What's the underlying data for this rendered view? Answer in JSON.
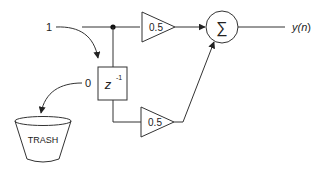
{
  "diagram": {
    "type": "signal-flow / block diagram",
    "colors": {
      "stroke": "#333333",
      "background": "#ffffff"
    },
    "input_label": "1",
    "state_label": "0",
    "delay": {
      "label_base": "z",
      "label_exp": "-1"
    },
    "gain_top": {
      "label": "0.5"
    },
    "gain_bottom": {
      "label": "0.5"
    },
    "summer": {
      "symbol": "∑"
    },
    "output_label": "y(n)",
    "output_label_base": "y(",
    "output_label_var": "n",
    "output_label_close": ")",
    "trash": {
      "label": "TRASH"
    }
  }
}
